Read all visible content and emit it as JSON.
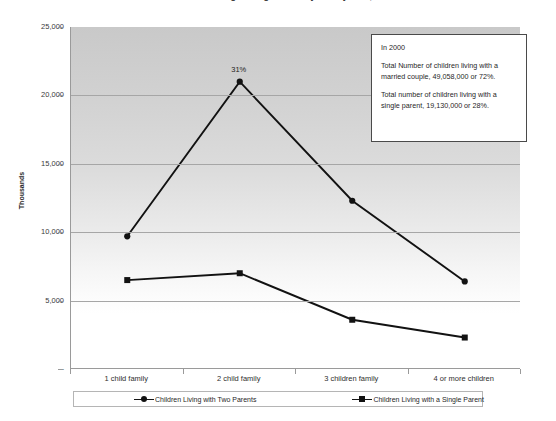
{
  "chart_title": "Children's Living Arrangements by Family Size, 2000",
  "annotation": {
    "heading": "In 2000",
    "line_married": "Total Number of children living with a married couple, 49,058,000 or 72%.",
    "line_single": "Total number of children living with a single parent, 19,130,000 or 28%."
  },
  "legend": {
    "series_two_parents": "Children Living with Two Parents",
    "series_single_parent": "Children Living with a Single Parent"
  },
  "colors": {
    "series_line": "#121212",
    "plot_background_top": "#c9c9c9",
    "plot_background_bottom": "#ffffff",
    "gridline": "#a6a6a6",
    "axis": "#9a9a9a"
  },
  "chart_data": {
    "type": "line",
    "title": "Children's Living Arrangements by Family Size, 2000",
    "xlabel": "",
    "ylabel": "Thousands",
    "categories": [
      "1 child family",
      "2 child family",
      "3 children family",
      "4 or more children"
    ],
    "ytick_labels": [
      "25,000",
      "20,000",
      "15,000",
      "10,000",
      "5,000",
      "-"
    ],
    "ytick_values": [
      25000,
      20000,
      15000,
      10000,
      5000,
      0
    ],
    "ylim": [
      0,
      25000
    ],
    "grid": true,
    "legend_position": "bottom",
    "series": [
      {
        "name": "Children Living with Two Parents",
        "marker": "circle",
        "values": [
          9700,
          21000,
          12300,
          6400
        ],
        "point_labels": [
          null,
          "31%",
          null,
          null
        ]
      },
      {
        "name": "Children Living with a Single Parent",
        "marker": "square",
        "values": [
          6500,
          7000,
          3600,
          2300
        ],
        "point_labels": [
          null,
          null,
          null,
          null
        ]
      }
    ],
    "annotations": [
      {
        "text": "31%",
        "attached_to": {
          "series": "Children Living with Two Parents",
          "category": "2 child family"
        }
      }
    ]
  }
}
